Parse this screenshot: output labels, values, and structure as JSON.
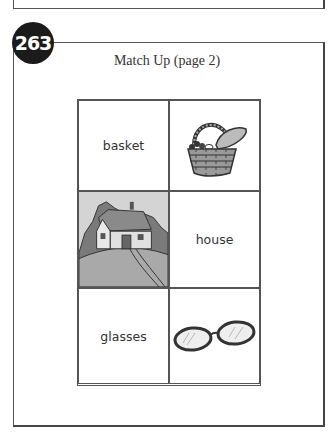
{
  "page_number": "263",
  "title": "Match Up (page 2)",
  "grid": [
    {
      "type": "word",
      "text": "basket"
    },
    {
      "type": "picture",
      "icon": "basket-icon",
      "alt": "basket"
    },
    {
      "type": "picture",
      "icon": "house-icon",
      "alt": "house"
    },
    {
      "type": "word",
      "text": "house"
    },
    {
      "type": "word",
      "text": "glasses"
    },
    {
      "type": "picture",
      "icon": "glasses-icon",
      "alt": "glasses"
    }
  ]
}
